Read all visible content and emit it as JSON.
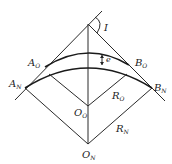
{
  "diagram": {
    "type": "geometry",
    "labels": {
      "I": "I",
      "e": "e",
      "A_O": {
        "base": "A",
        "sub": "O"
      },
      "A_N": {
        "base": "A",
        "sub": "N"
      },
      "B_O": {
        "base": "B",
        "sub": "O"
      },
      "B_N": {
        "base": "B",
        "sub": "N"
      },
      "O_O": {
        "base": "O",
        "sub": "O"
      },
      "O_N": {
        "base": "O",
        "sub": "N"
      },
      "R_O": {
        "base": "R",
        "sub": "O"
      },
      "R_N": {
        "base": "R",
        "sub": "N"
      }
    },
    "colors": {
      "line": "#2a2a2a",
      "background": "#ffffff"
    }
  }
}
